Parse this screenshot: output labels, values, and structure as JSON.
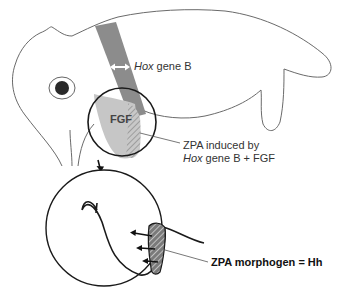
{
  "diagram": {
    "type": "embryo limb-bud patterning schematic",
    "labels": {
      "hox_band_italic": "Hox",
      "hox_band_rest": " gene B",
      "fgf": "FGF",
      "zpa_line1": "ZPA induced by",
      "zpa_line2_italic": "Hox",
      "zpa_line2_rest": " gene B + FGF",
      "morphogen": "ZPA morphogen = Hh"
    },
    "colors": {
      "outline": "#555555",
      "hox_band": "#8a8a8a",
      "fgf_region": "#c4c4c4",
      "zpa_hatch": "#6a6a6a",
      "circle": "#1a1a1a",
      "eye": "#2a2a2a"
    },
    "elements": [
      "embryo-outline",
      "eye",
      "hox-expression-band",
      "double-arrow",
      "limb-bud-zoom-circle",
      "fgf-region",
      "zpa-hatched-region",
      "down-arrow",
      "magnified-limb-bud-circle",
      "hh-signal-arrows"
    ]
  }
}
